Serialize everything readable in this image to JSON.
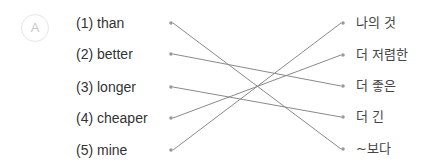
{
  "badge": "A",
  "left": [
    {
      "label": "(1) than",
      "y": 23
    },
    {
      "label": "(2) better",
      "y": 54
    },
    {
      "label": "(3) longer",
      "y": 87
    },
    {
      "label": "(4) cheaper",
      "y": 118
    },
    {
      "label": "(5) mine",
      "y": 150
    }
  ],
  "right": [
    {
      "label": "나의 것",
      "y": 23
    },
    {
      "label": "더 저렴한",
      "y": 55
    },
    {
      "label": "더 좋은",
      "y": 86
    },
    {
      "label": "더 긴",
      "y": 117
    },
    {
      "label": "~보다",
      "y": 149
    }
  ],
  "connections": [
    [
      0,
      4
    ],
    [
      1,
      2
    ],
    [
      2,
      3
    ],
    [
      3,
      1
    ],
    [
      4,
      0
    ]
  ],
  "colors": {
    "line": "#8a8a8a",
    "dot": "#999999"
  }
}
